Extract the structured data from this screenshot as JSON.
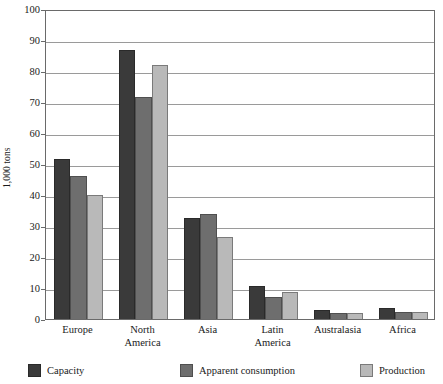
{
  "chart_data": {
    "type": "bar",
    "title": "",
    "subtitle": "",
    "xlabel": "",
    "ylabel": "1,000 tons",
    "ylim": [
      0,
      100
    ],
    "ytick_step": 10,
    "yticks": [
      "0",
      "10",
      "20",
      "30",
      "40",
      "50",
      "60",
      "70",
      "80",
      "90",
      "100"
    ],
    "grid": true,
    "grid_axis": "y",
    "legend_position": "bottom",
    "categories": [
      "Europe",
      "North\nAmerica",
      "Asia",
      "Latin\nAmerica",
      "Australasia",
      "Africa"
    ],
    "series": [
      {
        "name": "Capacity",
        "color": "#3a3a3a",
        "values": [
          51.5,
          86.8,
          32.5,
          10.8,
          3.0,
          3.4
        ]
      },
      {
        "name": "Apparent consumption",
        "color": "#6e6e6e",
        "values": [
          46.0,
          71.5,
          33.8,
          7.2,
          1.8,
          2.4
        ]
      },
      {
        "name": "Production",
        "color": "#b9b9b9",
        "values": [
          40.0,
          82.0,
          26.6,
          8.6,
          2.0,
          2.2
        ]
      }
    ]
  },
  "axis": {
    "y_title": "1,000 tons"
  },
  "legend": {
    "items": [
      {
        "label": "Capacity",
        "series": "s0"
      },
      {
        "label": "Apparent consumption",
        "series": "s1"
      },
      {
        "label": "Production",
        "series": "s2"
      }
    ]
  },
  "artifact": {
    "top_strip": ""
  }
}
